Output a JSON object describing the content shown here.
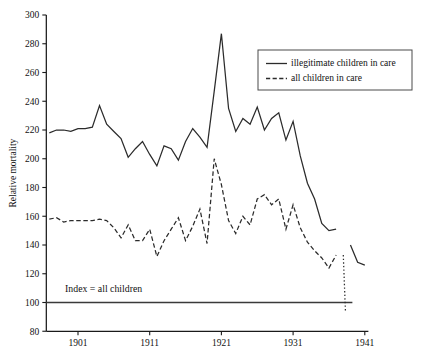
{
  "chart_data": {
    "type": "line",
    "title": "",
    "xlabel": "",
    "ylabel": "Relative mortality",
    "xlim": [
      1897,
      1941.5
    ],
    "ylim": [
      80,
      300
    ],
    "ytick_values": [
      80,
      100,
      120,
      140,
      160,
      180,
      200,
      220,
      240,
      260,
      280,
      300
    ],
    "ytick_labels": [
      "80",
      "100",
      "120",
      "140",
      "160",
      "180",
      "200",
      "220",
      "240",
      "260",
      "280",
      "300"
    ],
    "xtick_values": [
      1901,
      1911,
      1921,
      1931,
      1941
    ],
    "xtick_labels": [
      "1901",
      "1911",
      "1921",
      "1931",
      "1941"
    ],
    "grid": false,
    "legend_position": "upper right",
    "annotations": [
      {
        "name": "index-reference",
        "text": "Index = all children",
        "value": 100,
        "x": 1899.2,
        "label_y": 107
      }
    ],
    "series": [
      {
        "name": "illegitimate children in care",
        "style": "solid",
        "x": [
          1897,
          1898,
          1899,
          1900,
          1901,
          1902,
          1903,
          1904,
          1905,
          1906,
          1907,
          1908,
          1909,
          1910,
          1911,
          1912,
          1913,
          1914,
          1915,
          1916,
          1917,
          1918,
          1919,
          1920,
          1921,
          1922,
          1923,
          1924,
          1925,
          1926,
          1927,
          1928,
          1929,
          1930,
          1931,
          1932,
          1933,
          1934,
          1935,
          1936,
          1937
        ],
        "values": [
          218,
          220,
          220,
          219,
          221,
          221,
          222,
          237,
          224,
          219,
          214,
          201,
          207,
          212,
          203,
          195,
          209,
          207,
          199,
          212,
          221,
          215,
          208,
          247,
          287,
          235,
          219,
          228,
          224,
          236,
          220,
          228,
          232,
          213,
          226,
          202,
          183,
          172,
          155,
          150,
          151
        ],
        "segments": [
          {
            "name": "main-segment",
            "x": [
              1897,
              1898,
              1899,
              1900,
              1901,
              1902,
              1903,
              1904,
              1905,
              1906,
              1907,
              1908,
              1909,
              1910,
              1911,
              1912,
              1913,
              1914,
              1915,
              1916,
              1917,
              1918,
              1919,
              1920,
              1921,
              1922,
              1923,
              1924,
              1925,
              1926,
              1927,
              1928,
              1929,
              1930,
              1931,
              1932,
              1933,
              1934,
              1935,
              1936,
              1937
            ],
            "values": [
              218,
              220,
              220,
              219,
              221,
              221,
              222,
              237,
              224,
              219,
              214,
              201,
              207,
              212,
              203,
              195,
              209,
              207,
              199,
              212,
              221,
              215,
              208,
              247,
              287,
              235,
              219,
              228,
              224,
              236,
              220,
              228,
              232,
              213,
              226,
              202,
              183,
              172,
              155,
              150,
              151
            ]
          },
          {
            "name": "late-segment",
            "x": [
              1939,
              1940,
              1941
            ],
            "values": [
              140,
              128,
              126
            ]
          }
        ]
      },
      {
        "name": "all children in care",
        "style": "dashed",
        "x": [
          1897,
          1898,
          1899,
          1900,
          1901,
          1902,
          1903,
          1904,
          1905,
          1906,
          1907,
          1908,
          1909,
          1910,
          1911,
          1912,
          1913,
          1914,
          1915,
          1916,
          1917,
          1918,
          1919,
          1920,
          1921,
          1922,
          1923,
          1924,
          1925,
          1926,
          1927,
          1928,
          1929,
          1930,
          1931,
          1932,
          1933,
          1934,
          1935,
          1936,
          1937
        ],
        "values": [
          158,
          159,
          156,
          157,
          157,
          157,
          157,
          158,
          157,
          152,
          145,
          154,
          143,
          143,
          151,
          132,
          143,
          151,
          159,
          143,
          153,
          165,
          141,
          200,
          182,
          157,
          148,
          160,
          154,
          172,
          175,
          168,
          172,
          151,
          168,
          152,
          142,
          136,
          131,
          124,
          133
        ],
        "segments": [
          {
            "name": "main-segment",
            "x": [
              1897,
              1898,
              1899,
              1900,
              1901,
              1902,
              1903,
              1904,
              1905,
              1906,
              1907,
              1908,
              1909,
              1910,
              1911,
              1912,
              1913,
              1914,
              1915,
              1916,
              1917,
              1918,
              1919,
              1920,
              1921,
              1922,
              1923,
              1924,
              1925,
              1926,
              1927,
              1928,
              1929,
              1930,
              1931,
              1932,
              1933,
              1934,
              1935,
              1936,
              1937
            ],
            "values": [
              158,
              159,
              156,
              157,
              157,
              157,
              157,
              158,
              157,
              152,
              145,
              154,
              143,
              143,
              151,
              132,
              143,
              151,
              159,
              143,
              153,
              165,
              141,
              200,
              182,
              157,
              148,
              160,
              154,
              172,
              175,
              168,
              172,
              151,
              168,
              152,
              142,
              136,
              131,
              124,
              133
            ]
          }
        ],
        "dotted_tail": {
          "name": "dotted-drop",
          "x": [
            1938,
            1938.3
          ],
          "values": [
            133,
            94
          ]
        }
      }
    ]
  },
  "legend": {
    "entries": [
      {
        "label": "illegitimate children in care",
        "style": "solid"
      },
      {
        "label": "all children in care",
        "style": "dashed"
      }
    ]
  },
  "axis": {
    "y_title": "Relative mortality"
  }
}
